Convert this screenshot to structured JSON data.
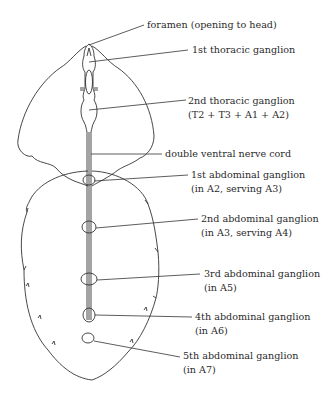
{
  "diagram": {
    "labels": [
      {
        "id": "foramen",
        "lines": [
          "foramen (opening to head)"
        ]
      },
      {
        "id": "thoracic-1",
        "lines": [
          "1st thoracic ganglion"
        ]
      },
      {
        "id": "thoracic-2",
        "lines": [
          "2nd thoracic ganglion",
          "(T2 + T3 + A1 + A2)"
        ]
      },
      {
        "id": "nerve-cord",
        "lines": [
          "double ventral nerve cord"
        ]
      },
      {
        "id": "abdominal-1",
        "lines": [
          "1st abdominal ganglion",
          "(in A2, serving A3)"
        ]
      },
      {
        "id": "abdominal-2",
        "lines": [
          "2nd abdominal ganglion",
          "(in A3, serving A4)"
        ]
      },
      {
        "id": "abdominal-3",
        "lines": [
          "3rd abdominal ganglion",
          "(in A5)"
        ]
      },
      {
        "id": "abdominal-4",
        "lines": [
          "4th abdominal ganglion",
          "(in A6)"
        ]
      },
      {
        "id": "abdominal-5",
        "lines": [
          "5th abdominal ganglion",
          "(in A7)"
        ]
      }
    ],
    "colors": {
      "line": "#333333",
      "text": "#2a2a2a",
      "background": "#ffffff"
    }
  }
}
